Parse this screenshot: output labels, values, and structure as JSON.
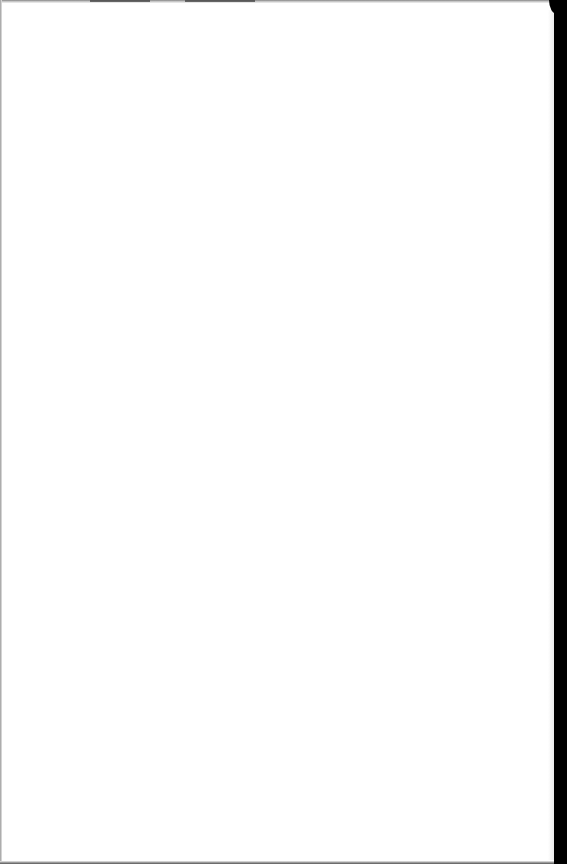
{
  "document": {
    "description": "Blank scanned page",
    "text_content": ""
  },
  "colors": {
    "paper": "#ffffff",
    "right_border": "#000000",
    "edge_shadow": "#6e6e6e"
  }
}
